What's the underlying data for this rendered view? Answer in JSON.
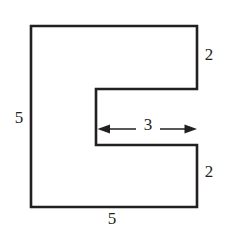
{
  "figure": {
    "type": "geometry-diagram",
    "stroke_color": "#231f20",
    "fill_color": "#ffffff",
    "background_color": "#ffffff",
    "outline": {
      "name": "c-shaped-polygon",
      "points": [
        [
          31,
          26
        ],
        [
          197,
          26
        ],
        [
          197,
          89
        ],
        [
          96,
          89
        ],
        [
          96,
          145
        ],
        [
          197,
          145
        ],
        [
          197,
          207
        ],
        [
          31,
          207
        ]
      ]
    },
    "labels": [
      {
        "id": "left-5",
        "text": "5",
        "position": "left side",
        "x": 19,
        "y": 118
      },
      {
        "id": "bottom-5",
        "text": "5",
        "position": "bottom side",
        "x": 112,
        "y": 219
      },
      {
        "id": "top-right-2",
        "text": "2",
        "position": "upper right arm height",
        "x": 208,
        "y": 55
      },
      {
        "id": "bottom-right-2",
        "text": "2",
        "position": "lower right arm height",
        "x": 208,
        "y": 172
      },
      {
        "id": "notch-3",
        "text": "3",
        "position": "notch width inside",
        "x": 148,
        "y": 124
      }
    ],
    "dimension_arrow": {
      "name": "notch-width-arrow",
      "orientation": "horizontal",
      "double_headed": true,
      "x_start": 98,
      "x_end": 197,
      "y": 129,
      "label": "3"
    }
  }
}
